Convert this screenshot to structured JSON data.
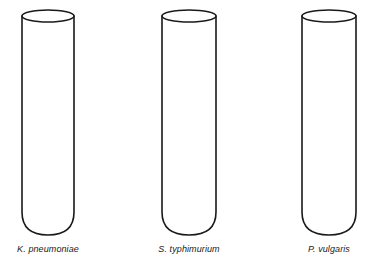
{
  "figure": {
    "background_color": "#ffffff",
    "stroke_color": "#1a1a1a",
    "fill_color": "#ffffff",
    "caption_color": "#1a1a1a",
    "width": 377,
    "height": 269
  },
  "tubes": [
    {
      "label": "K. pneumoniae",
      "organism_genus_initial": "K.",
      "organism_species": "pneumoniae",
      "contents_appearance": "clear / uninoculated",
      "fill_color": "#ffffff",
      "geometry": {
        "left": 22,
        "right": 74,
        "top": 10,
        "bottom": 235,
        "rim_ellipse_height": 12
      }
    },
    {
      "label": "S. typhimurium",
      "organism_genus_initial": "S.",
      "organism_species": "typhimurium",
      "contents_appearance": "clear / uninoculated",
      "fill_color": "#ffffff",
      "geometry": {
        "left": 162,
        "right": 216,
        "top": 10,
        "bottom": 235,
        "rim_ellipse_height": 12
      }
    },
    {
      "label": "P. vulgaris",
      "organism_genus_initial": "P.",
      "organism_species": "vulgaris",
      "contents_appearance": "clear / uninoculated",
      "fill_color": "#ffffff",
      "geometry": {
        "left": 302,
        "right": 356,
        "top": 10,
        "bottom": 235,
        "rim_ellipse_height": 12
      }
    }
  ]
}
